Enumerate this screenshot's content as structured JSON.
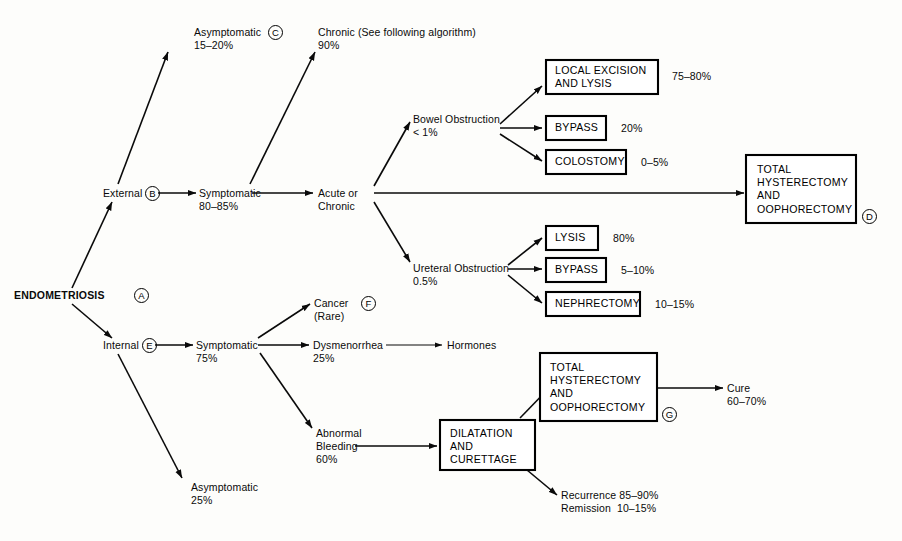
{
  "diagram": {
    "type": "decision-tree",
    "background_color": "#fdfdfb",
    "line_color": "#0a0a0a",
    "root": {
      "label": "ENDOMETRIOSIS",
      "marker": "A"
    },
    "nodes": [
      {
        "id": "external",
        "line1": "External",
        "line2": "",
        "marker": "B"
      },
      {
        "id": "internal",
        "line1": "Internal",
        "line2": "",
        "marker": "E"
      },
      {
        "id": "ext-asymptomatic",
        "line1": "Asymptomatic",
        "line2": "15–20%",
        "marker": "C"
      },
      {
        "id": "ext-symptomatic",
        "line1": "Symptomatic",
        "line2": "80–85%",
        "marker": ""
      },
      {
        "id": "chronic",
        "line1": "Chronic (See following algorithm)",
        "line2": "90%",
        "marker": ""
      },
      {
        "id": "acute-or-chronic",
        "line1": "Acute or",
        "line2": "Chronic",
        "marker": ""
      },
      {
        "id": "bowel-obstruction",
        "line1": "Bowel Obstruction",
        "line2": "< 1%",
        "marker": ""
      },
      {
        "id": "ureteral-obstruction",
        "line1": "Ureteral Obstruction",
        "line2": "0.5%",
        "marker": ""
      },
      {
        "id": "int-symptomatic",
        "line1": "Symptomatic",
        "line2": "75%",
        "marker": ""
      },
      {
        "id": "int-asymptomatic",
        "line1": "Asymptomatic",
        "line2": "25%",
        "marker": ""
      },
      {
        "id": "cancer",
        "line1": "Cancer",
        "line2": "(Rare)",
        "marker": "F"
      },
      {
        "id": "dysmenorrhea",
        "line1": "Dysmenorrhea",
        "line2": "25%",
        "marker": ""
      },
      {
        "id": "hormones",
        "line1": "Hormones",
        "line2": "",
        "marker": ""
      },
      {
        "id": "abnormal-bleeding",
        "line1": "Abnormal",
        "line2": "Bleeding",
        "line3": "60%",
        "marker": ""
      },
      {
        "id": "cure",
        "line1": "Cure",
        "line2": "60–70%",
        "marker": ""
      },
      {
        "id": "recurrence",
        "line1": "Recurrence 85–90%",
        "line2": "Remission  10–15%",
        "marker": ""
      }
    ],
    "boxes": [
      {
        "id": "local-excision",
        "text": "LOCAL EXCISION\nAND LYSIS",
        "rate": "75–80%",
        "marker": ""
      },
      {
        "id": "bowel-bypass",
        "text": "BYPASS",
        "rate": "20%",
        "marker": ""
      },
      {
        "id": "colostomy",
        "text": "COLOSTOMY",
        "rate": "0–5%",
        "marker": ""
      },
      {
        "id": "lysis",
        "text": "LYSIS",
        "rate": "80%",
        "marker": ""
      },
      {
        "id": "ureteral-bypass",
        "text": "BYPASS",
        "rate": "5–10%",
        "marker": ""
      },
      {
        "id": "nephrectomy",
        "text": "NEPHRECTOMY",
        "rate": "10–15%",
        "marker": ""
      },
      {
        "id": "tah-bso-upper",
        "text": "TOTAL\nHYSTERECTOMY\nAND\nOOPHORECTOMY",
        "rate": "",
        "marker": "D"
      },
      {
        "id": "tah-bso-lower",
        "text": "TOTAL\nHYSTERECTOMY\nAND\nOOPHORECTOMY",
        "rate": "",
        "marker": "G"
      },
      {
        "id": "dilatation-curettage",
        "text": "DILATATION\nAND\nCURETTAGE",
        "rate": "",
        "marker": ""
      }
    ]
  }
}
